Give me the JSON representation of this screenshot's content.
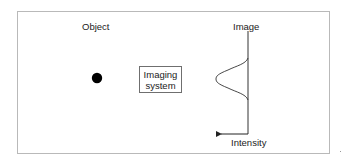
{
  "diagram": {
    "labels": {
      "object": "Object",
      "image": "Image",
      "intensity": "Intensity",
      "imaging_system_line1": "Imaging",
      "imaging_system_line2": "system"
    },
    "elements": {
      "object_point": {
        "shape": "filled-circle",
        "cx": 97,
        "cy": 78,
        "r": 5,
        "color": "#000000"
      },
      "imaging_system_box": {
        "x": 139,
        "y": 66,
        "w": 43,
        "h": 27
      },
      "image_plane_line": {
        "x": 248,
        "y1": 31,
        "y2": 134
      },
      "intensity_profile": {
        "shape": "gaussian",
        "baseline_x": 248,
        "peak_x": 216,
        "peak_y": 79,
        "y_start": 58,
        "y_end": 100
      },
      "intensity_arrow": {
        "from_x": 248,
        "to_x": 217,
        "y": 134,
        "direction": "left"
      }
    },
    "colors": {
      "frame": "#b9b9b9",
      "stroke": "#333333",
      "text": "#222222"
    }
  }
}
